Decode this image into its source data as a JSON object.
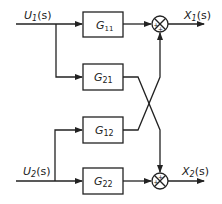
{
  "inputs": [
    {
      "label": "U",
      "sub": "1",
      "arg": "(s)"
    },
    {
      "label": "U",
      "sub": "2",
      "arg": "(s)"
    }
  ],
  "outputs": [
    {
      "label": "X",
      "sub": "1",
      "arg": "(s)"
    },
    {
      "label": "X",
      "sub": "2",
      "arg": "(s)"
    }
  ],
  "blocks": [
    {
      "label": "G",
      "sub": "11"
    },
    {
      "label": "G",
      "sub": "21"
    },
    {
      "label": "G",
      "sub": "12"
    },
    {
      "label": "G",
      "sub": "22"
    }
  ],
  "junctions": [
    {
      "signs": [
        "+",
        "+"
      ]
    },
    {
      "signs": [
        "+",
        "+"
      ]
    }
  ],
  "colors": {
    "line": "#222222",
    "background": "#ffffff"
  }
}
